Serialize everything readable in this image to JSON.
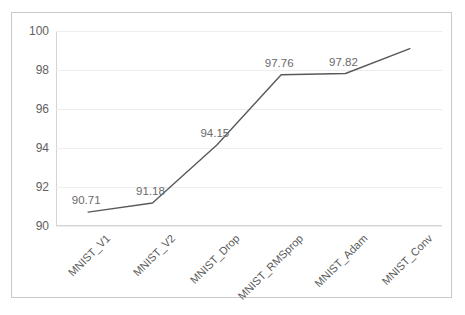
{
  "top_partial_text": "·  ·  ·     ·",
  "axis": {
    "y_ticks": [
      "100",
      "98",
      "96",
      "94",
      "92",
      "90"
    ]
  },
  "colors": {
    "line": "#595959",
    "frame": "#c9c9c9",
    "grid": "#ededed",
    "axis": "#d4d4d4",
    "label_text": "#6a6a6a",
    "tick_text": "#5a5a5a"
  },
  "chart_data": {
    "type": "line",
    "title": "",
    "subtitle": "",
    "xlabel": "",
    "ylabel": "",
    "categories": [
      "MNIST_V1",
      "MNIST_V2",
      "MNIST_Drop",
      "MNIST_RMSprop",
      "MNIST_Adam",
      "MNIST_Conv"
    ],
    "values": [
      90.71,
      91.18,
      94.15,
      97.76,
      97.82,
      99.1
    ],
    "point_labels": [
      "90.71",
      "91.18",
      "94.15",
      "97.76",
      "97.82",
      ""
    ],
    "ylim": [
      90,
      100
    ],
    "yticks": [
      90,
      92,
      94,
      96,
      98,
      100
    ],
    "grid": true,
    "legend": "none",
    "markers": false,
    "series": [
      {
        "name": "accuracy",
        "values": [
          90.71,
          91.18,
          94.15,
          97.76,
          97.82,
          99.1
        ]
      }
    ]
  }
}
